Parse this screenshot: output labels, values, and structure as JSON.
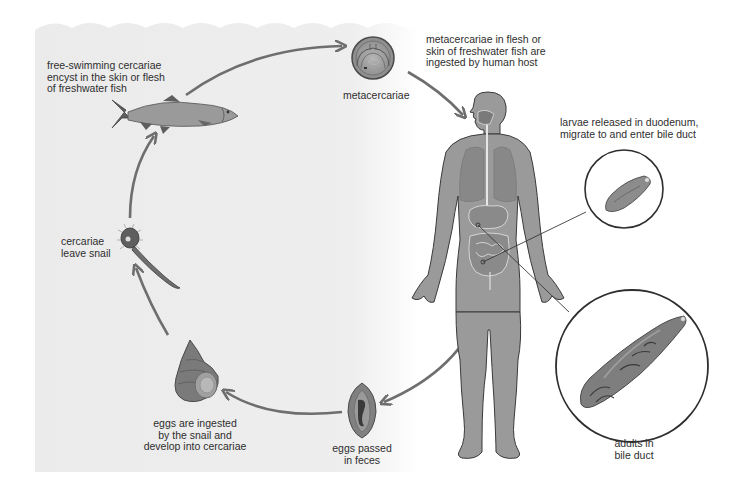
{
  "diagram": {
    "type": "life-cycle",
    "colors": {
      "water": "#ececec",
      "arrow": "#6e6e6e",
      "body_fill": "#9a9a9a",
      "organ_fill": "#808080",
      "outline": "#3a3a3a"
    },
    "stages": [
      {
        "id": "fish",
        "label": "free-swimming cercariae\nencyst in the skin or flesh\nof freshwater fish"
      },
      {
        "id": "metacercariae",
        "label": "metacercariae"
      },
      {
        "id": "ingestion",
        "label": "metacercariae in flesh or\nskin of freshwater fish are\ningested by human host"
      },
      {
        "id": "larvae",
        "label": "larvae released in duodenum,\nmigrate to and enter bile duct"
      },
      {
        "id": "adults",
        "label": "adults in\nbile duct"
      },
      {
        "id": "eggs",
        "label": "eggs passed\nin feces"
      },
      {
        "id": "snail",
        "label": "eggs are ingested\nby the snail and\ndevelop into cercariae"
      },
      {
        "id": "cercariae",
        "label": "cercariae\nleave snail"
      }
    ],
    "flow": [
      "snail",
      "cercariae",
      "fish",
      "metacercariae",
      "human",
      "eggs",
      "snail"
    ]
  }
}
